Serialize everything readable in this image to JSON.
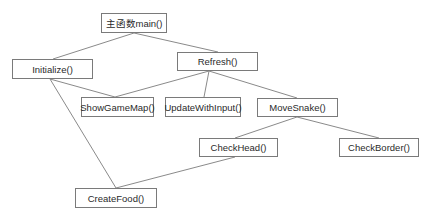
{
  "diagram": {
    "type": "function-call-tree",
    "colors": {
      "line": "#8a8a8a",
      "border": "#7a7a7a",
      "text": "#2a2a2a",
      "background": "#ffffff"
    },
    "nodes": [
      {
        "id": "main",
        "label": "主函数main()",
        "x": 101,
        "y": 13,
        "w": 66,
        "h": 20
      },
      {
        "id": "init",
        "label": "Initialize()",
        "x": 12,
        "y": 59,
        "w": 81,
        "h": 20
      },
      {
        "id": "refresh",
        "label": "Refresh()",
        "x": 177,
        "y": 52,
        "w": 81,
        "h": 19
      },
      {
        "id": "showmap",
        "label": "ShowGameMap()",
        "x": 81,
        "y": 97,
        "w": 73,
        "h": 20
      },
      {
        "id": "update",
        "label": "UpdateWithInput()",
        "x": 165,
        "y": 97,
        "w": 76,
        "h": 20
      },
      {
        "id": "move",
        "label": "MoveSnake()",
        "x": 257,
        "y": 98,
        "w": 81,
        "h": 19
      },
      {
        "id": "head",
        "label": "CheckHead()",
        "x": 199,
        "y": 138,
        "w": 79,
        "h": 19
      },
      {
        "id": "border",
        "label": "CheckBorder()",
        "x": 339,
        "y": 138,
        "w": 80,
        "h": 19
      },
      {
        "id": "food",
        "label": "CreateFood()",
        "x": 75,
        "y": 188,
        "w": 82,
        "h": 20
      }
    ],
    "edges": [
      {
        "from": "main",
        "to": "init",
        "x1": 134,
        "y1": 33,
        "x2": 53,
        "y2": 59
      },
      {
        "from": "main",
        "to": "refresh",
        "x1": 134,
        "y1": 33,
        "x2": 218,
        "y2": 52
      },
      {
        "from": "init",
        "to": "showmap",
        "x1": 50,
        "y1": 79,
        "x2": 115,
        "y2": 97
      },
      {
        "from": "init",
        "to": "food",
        "x1": 50,
        "y1": 79,
        "x2": 116,
        "y2": 188
      },
      {
        "from": "refresh",
        "to": "showmap",
        "x1": 209,
        "y1": 71,
        "x2": 115,
        "y2": 97
      },
      {
        "from": "refresh",
        "to": "update",
        "x1": 209,
        "y1": 71,
        "x2": 204,
        "y2": 97
      },
      {
        "from": "refresh",
        "to": "move",
        "x1": 209,
        "y1": 71,
        "x2": 297,
        "y2": 98
      },
      {
        "from": "move",
        "to": "head",
        "x1": 297,
        "y1": 117,
        "x2": 235,
        "y2": 138
      },
      {
        "from": "move",
        "to": "border",
        "x1": 297,
        "y1": 117,
        "x2": 379,
        "y2": 138
      },
      {
        "from": "head",
        "to": "food",
        "x1": 235,
        "y1": 157,
        "x2": 116,
        "y2": 188
      }
    ]
  }
}
